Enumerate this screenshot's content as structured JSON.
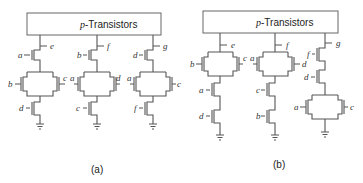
{
  "figure": {
    "panel_a": {
      "box_title_var": "p",
      "box_title_text": "-Transistors",
      "caption": "(a)",
      "outputs": [
        "e",
        "f",
        "g"
      ],
      "columns": [
        {
          "output": "e",
          "top": "a",
          "parallel_left": "b",
          "parallel_right": "c",
          "bottom": "d"
        },
        {
          "output": "f",
          "top": "b",
          "parallel_left": "a",
          "parallel_right": "d",
          "bottom": "c"
        },
        {
          "output": "g",
          "top": "d",
          "parallel_left": "a",
          "parallel_right": "c",
          "bottom": "f"
        }
      ]
    },
    "panel_b": {
      "box_title_var": "p",
      "box_title_text": "-Transistors",
      "caption": "(b)",
      "outputs": [
        "e",
        "f",
        "g"
      ],
      "columns": [
        {
          "output": "e",
          "parallel_left": "b",
          "parallel_right": "c",
          "series1": "a",
          "series2": "d"
        },
        {
          "output": "f",
          "parallel_left": "a",
          "parallel_right": "d",
          "series1": "c",
          "series2": "b"
        },
        {
          "output": "g",
          "series1": "f",
          "series2": "d",
          "parallel_left": "a",
          "parallel_right": "c"
        }
      ]
    }
  }
}
